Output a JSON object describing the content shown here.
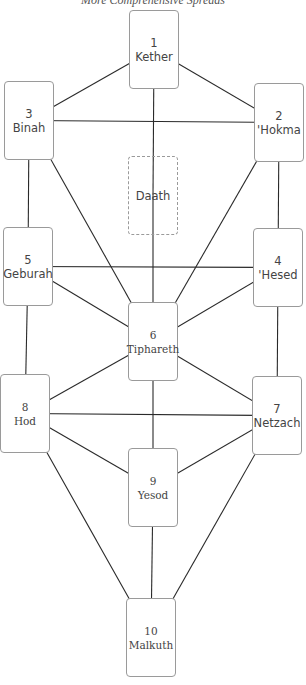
{
  "header": {
    "title": "More Comprehensive Spreads"
  },
  "cards": [
    {
      "id": "kether",
      "number": "1",
      "name": "Kether"
    },
    {
      "id": "hokma",
      "number": "2",
      "name": "'Hokma"
    },
    {
      "id": "binah",
      "number": "3",
      "name": "Binah"
    },
    {
      "id": "hesed",
      "number": "4",
      "name": "'Hesed"
    },
    {
      "id": "geburah",
      "number": "5",
      "name": "Geburah"
    },
    {
      "id": "tiphareth",
      "number": "6",
      "name": "Tiphareth"
    },
    {
      "id": "netzach",
      "number": "7",
      "name": "Netzach"
    },
    {
      "id": "hod",
      "number": "8",
      "name": "Hod"
    },
    {
      "id": "yesod",
      "number": "9",
      "name": "Yesod"
    },
    {
      "id": "malkuth",
      "number": "10",
      "name": "Malkuth"
    },
    {
      "id": "daath",
      "number": "",
      "name": "Daath",
      "hidden_sephira": true
    }
  ],
  "paths": [
    [
      "kether",
      "binah"
    ],
    [
      "kether",
      "hokma"
    ],
    [
      "kether",
      "daath"
    ],
    [
      "binah",
      "hokma"
    ],
    [
      "binah",
      "geburah"
    ],
    [
      "binah",
      "tiphareth"
    ],
    [
      "hokma",
      "hesed"
    ],
    [
      "hokma",
      "tiphareth"
    ],
    [
      "daath",
      "tiphareth"
    ],
    [
      "geburah",
      "hesed"
    ],
    [
      "geburah",
      "tiphareth"
    ],
    [
      "geburah",
      "hod"
    ],
    [
      "hesed",
      "tiphareth"
    ],
    [
      "hesed",
      "netzach"
    ],
    [
      "tiphareth",
      "hod"
    ],
    [
      "tiphareth",
      "netzach"
    ],
    [
      "tiphareth",
      "yesod"
    ],
    [
      "hod",
      "netzach"
    ],
    [
      "hod",
      "yesod"
    ],
    [
      "hod",
      "malkuth"
    ],
    [
      "netzach",
      "yesod"
    ],
    [
      "netzach",
      "malkuth"
    ],
    [
      "yesod",
      "malkuth"
    ]
  ]
}
